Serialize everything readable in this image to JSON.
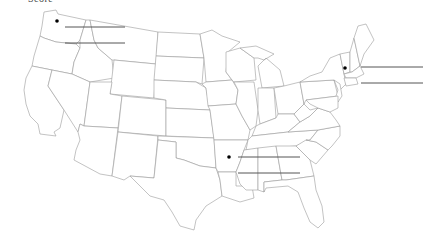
{
  "worksheet": {
    "title": "Score"
  },
  "map": {
    "subject": "Blank map of the contiguous United States",
    "markers": [
      {
        "id": "northwest",
        "location": "Washington",
        "x": 57,
        "y": 21
      },
      {
        "id": "northeast",
        "location": "Vermont / New Hampshire",
        "x": 345,
        "y": 68
      },
      {
        "id": "south",
        "location": "Arkansas",
        "x": 229,
        "y": 157
      }
    ],
    "answer_lines": [
      {
        "group": "northwest",
        "x1": 65,
        "x2": 125,
        "y": 27
      },
      {
        "group": "northwest",
        "x1": 65,
        "x2": 125,
        "y": 43
      },
      {
        "group": "northeast",
        "x1": 361,
        "x2": 423,
        "y": 67
      },
      {
        "group": "northeast",
        "x1": 361,
        "x2": 423,
        "y": 83
      },
      {
        "group": "south",
        "x1": 238,
        "x2": 300,
        "y": 157
      },
      {
        "group": "south",
        "x1": 238,
        "x2": 300,
        "y": 173
      }
    ],
    "colors": {
      "state_border": "#9a9a9a",
      "answer_line": "#555555",
      "marker": "#000000",
      "background": "#ffffff"
    }
  }
}
